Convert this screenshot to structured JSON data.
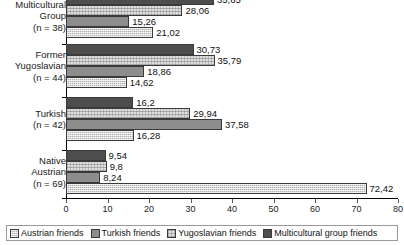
{
  "chart_data": {
    "type": "bar",
    "orientation": "horizontal",
    "title": "",
    "xlabel": "",
    "ylabel": "",
    "xlim": [
      0,
      80
    ],
    "xticks": [
      0,
      10,
      20,
      30,
      40,
      50,
      60,
      70,
      80
    ],
    "grid": false,
    "legend_position": "bottom",
    "decimal_separator": ",",
    "categories": [
      "Multicultural Group (n = 38)",
      "Former Yugoslavian (n = 44)",
      "Turkish (n = 42)",
      "Native Austrian (n = 69)"
    ],
    "series": [
      {
        "name": "Multicultural group friends",
        "swatch": "dark-solid",
        "color": "#4d4d4d",
        "values": [
          35.65,
          30.73,
          16.2,
          9.54
        ],
        "labels": [
          "35,65",
          "30,73",
          "16,2",
          "9,54"
        ]
      },
      {
        "name": "Yugoslavian friends",
        "swatch": "light-speckle",
        "color": "#dedede",
        "values": [
          28.06,
          35.79,
          29.94,
          9.8
        ],
        "labels": [
          "28,06",
          "35,79",
          "29,94",
          "9,8"
        ]
      },
      {
        "name": "Turkish friends",
        "swatch": "medium-gray",
        "color": "#8d8d8d",
        "values": [
          15.26,
          18.86,
          37.58,
          8.24
        ],
        "labels": [
          "15,26",
          "18,86",
          "37,58",
          "8,24"
        ]
      },
      {
        "name": "Austrian friends",
        "swatch": "dotted-crosshatch",
        "color": "#b0b0b0",
        "values": [
          21.02,
          14.62,
          16.28,
          72.42
        ],
        "labels": [
          "21,02",
          "14,62",
          "16,28",
          "72,42"
        ]
      }
    ]
  },
  "groups": [
    {
      "lines": [
        "Multicultural",
        "Group",
        "(n = 38)"
      ]
    },
    {
      "lines": [
        "Former",
        "Yugoslavian",
        "(n = 44)"
      ]
    },
    {
      "lines": [
        "Turkish",
        "(n = 42)"
      ]
    },
    {
      "lines": [
        "Native",
        "Austrian",
        "(n = 69)"
      ]
    }
  ],
  "axis": {
    "ticks": [
      "0",
      "10",
      "20",
      "30",
      "40",
      "50",
      "60",
      "70",
      "80"
    ]
  },
  "legend": {
    "items": [
      {
        "label": "Austrian friends",
        "swatch": "dotted-crosshatch"
      },
      {
        "label": "Turkish friends",
        "swatch": "medium-gray"
      },
      {
        "label": "Yugoslavian friends",
        "swatch": "light-speckle"
      },
      {
        "label": "Multicultural group friends",
        "swatch": "dark-solid"
      }
    ]
  }
}
